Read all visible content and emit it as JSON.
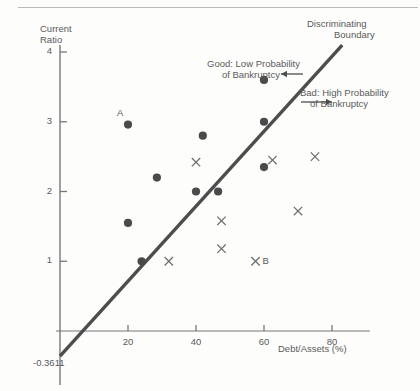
{
  "chart_data": {
    "type": "scatter",
    "title": "",
    "xlabel": "Debt/Assets (%)",
    "ylabel_line1": "Current",
    "ylabel_line2": "Ratio",
    "xlim": [
      0,
      95
    ],
    "ylim": [
      -0.55,
      4.35
    ],
    "xticks": [
      20,
      40,
      60,
      80
    ],
    "xtick_labels": [
      "20",
      "40",
      "60",
      "80"
    ],
    "yticks": [
      1,
      2,
      3,
      4
    ],
    "ytick_labels": [
      "1",
      "2",
      "3",
      "4"
    ],
    "grid": false,
    "legend_position": "none",
    "intercept_label": "-0.3611",
    "boundary": {
      "label_line1": "Discriminating",
      "label_line2": "Boundary",
      "intercept": -0.3611,
      "x_start": 0,
      "y_start": -0.3611,
      "x_end": 83,
      "y_end": 4.1
    },
    "series": [
      {
        "name": "Good: Low Probability of Bankruptcy",
        "marker": "dot",
        "color": "#4a4a4a",
        "points": [
          {
            "x": 20.0,
            "y": 2.96,
            "label": "A"
          },
          {
            "x": 28.5,
            "y": 2.2,
            "label": ""
          },
          {
            "x": 20.0,
            "y": 1.55,
            "label": ""
          },
          {
            "x": 24.0,
            "y": 1.0,
            "label": ""
          },
          {
            "x": 42.0,
            "y": 2.8,
            "label": ""
          },
          {
            "x": 40.0,
            "y": 2.0,
            "label": ""
          },
          {
            "x": 46.5,
            "y": 2.0,
            "label": ""
          },
          {
            "x": 60.0,
            "y": 3.6,
            "label": ""
          },
          {
            "x": 60.0,
            "y": 3.0,
            "label": ""
          },
          {
            "x": 60.0,
            "y": 2.35,
            "label": ""
          }
        ]
      },
      {
        "name": "Bad: High Probability of Bankruptcy",
        "marker": "x",
        "color": "#6a6a6a",
        "points": [
          {
            "x": 40.0,
            "y": 2.42,
            "label": ""
          },
          {
            "x": 32.0,
            "y": 1.0,
            "label": ""
          },
          {
            "x": 47.5,
            "y": 1.58,
            "label": ""
          },
          {
            "x": 47.5,
            "y": 1.18,
            "label": ""
          },
          {
            "x": 57.5,
            "y": 1.0,
            "label": "B"
          },
          {
            "x": 62.5,
            "y": 2.45,
            "label": ""
          },
          {
            "x": 70.0,
            "y": 1.72,
            "label": ""
          },
          {
            "x": 75.0,
            "y": 2.5,
            "label": ""
          }
        ]
      }
    ],
    "annotations": [
      {
        "name": "good-region",
        "line1": "Good: Low Probability",
        "line2": "of Bankruptcy",
        "arrow": "left"
      },
      {
        "name": "bad-region",
        "line1": "Bad: High Probability",
        "line2": "of Bankruptcy",
        "arrow": "right"
      }
    ]
  },
  "colors": {
    "axis": "#777777",
    "boundary_line": "#4d4d4d",
    "dot": "#4a4a4a",
    "cross": "#6e6e6e",
    "text": "#5a5a5a",
    "rule": "#b9b9b9",
    "background": "#fdfdfc"
  }
}
